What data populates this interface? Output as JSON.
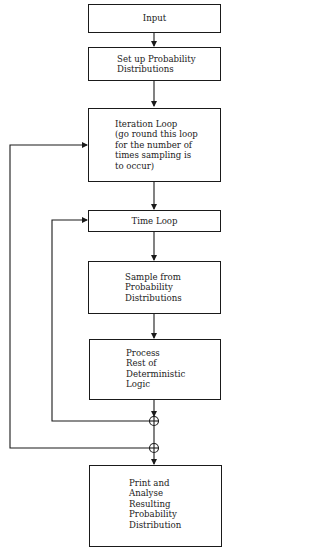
{
  "diagram": {
    "type": "flowchart",
    "nodes": [
      {
        "id": "input",
        "lines": [
          "Input"
        ]
      },
      {
        "id": "setup",
        "lines": [
          "Set up Probability",
          "Distributions"
        ]
      },
      {
        "id": "iteration",
        "lines": [
          "Iteration Loop",
          "(go round this loop",
          "for the number of",
          "times sampling is",
          "to occur)"
        ]
      },
      {
        "id": "time",
        "lines": [
          "Time Loop"
        ]
      },
      {
        "id": "sample",
        "lines": [
          "Sample from",
          "Probability",
          "Distributions"
        ]
      },
      {
        "id": "process",
        "lines": [
          "Process",
          "Rest of",
          "Deterministic",
          "Logic"
        ]
      },
      {
        "id": "print",
        "lines": [
          "Print and",
          "Analyse",
          "Resulting",
          "Probability",
          "Distribution"
        ]
      }
    ],
    "edges": [
      {
        "from": "input",
        "to": "setup"
      },
      {
        "from": "setup",
        "to": "iteration"
      },
      {
        "from": "iteration",
        "to": "time"
      },
      {
        "from": "time",
        "to": "sample"
      },
      {
        "from": "sample",
        "to": "process"
      },
      {
        "from": "process",
        "to": "junction-inner"
      },
      {
        "from": "junction-inner",
        "to": "time",
        "label": "inner loop back"
      },
      {
        "from": "junction-inner",
        "to": "junction-outer"
      },
      {
        "from": "junction-outer",
        "to": "iteration",
        "label": "outer loop back"
      },
      {
        "from": "junction-outer",
        "to": "print"
      }
    ],
    "colors": {
      "line": "#1a1a1a",
      "background": "#ffffff"
    }
  }
}
